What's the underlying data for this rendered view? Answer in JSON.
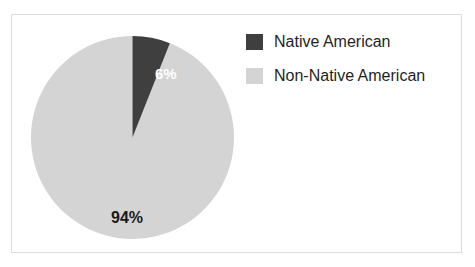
{
  "frame": {
    "border_color": "#dcdcdc",
    "background": "#ffffff"
  },
  "chart_data": {
    "type": "pie",
    "title": "",
    "categories": [
      "Native American",
      "Non-Native American"
    ],
    "values": [
      6,
      94
    ],
    "value_unit": "%",
    "data_labels": [
      "6%",
      "94%"
    ],
    "colors": [
      "#3f3f3f",
      "#d4d4d4"
    ],
    "start_angle_deg": 0,
    "direction": "clockwise",
    "legend": {
      "position": "right",
      "entries": [
        {
          "label": "Native American",
          "color": "#3f3f3f"
        },
        {
          "label": "Non-Native American",
          "color": "#d4d4d4"
        }
      ]
    },
    "labels": {
      "minor": "6%",
      "major": "94%"
    },
    "label_colors": {
      "minor": "#ffffff",
      "major": "#1a1a1a"
    }
  }
}
